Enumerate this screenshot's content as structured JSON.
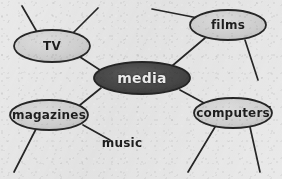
{
  "diagram": {
    "style": "hand-drawn sketch on gray paper",
    "background_color": "#e9e9e9",
    "ink_color": "#262626",
    "central_node": {
      "label": "media",
      "fill_color": "#4a4a4a",
      "text_color": "#f2f2f2",
      "cx": 142,
      "cy": 78,
      "rx": 48,
      "ry": 16,
      "font_size": 14
    },
    "nodes": [
      {
        "id": "tv",
        "label": "TV",
        "fill_color": "#d2d2d2",
        "text_color": "#1e1e1e",
        "cx": 52,
        "cy": 46,
        "rx": 38,
        "ry": 16,
        "font_size": 12
      },
      {
        "id": "films",
        "label": "films",
        "fill_color": "#d2d2d2",
        "text_color": "#1e1e1e",
        "cx": 228,
        "cy": 25,
        "rx": 38,
        "ry": 15,
        "font_size": 12
      },
      {
        "id": "magazines",
        "label": "magazines",
        "fill_color": "#d2d2d2",
        "text_color": "#1e1e1e",
        "cx": 49,
        "cy": 115,
        "rx": 39,
        "ry": 15,
        "font_size": 12
      },
      {
        "id": "computers",
        "label": "computers",
        "fill_color": "#d2d2d2",
        "text_color": "#1e1e1e",
        "cx": 233,
        "cy": 113,
        "rx": 39,
        "ry": 15,
        "font_size": 12
      }
    ],
    "text_nodes": [
      {
        "id": "music",
        "label": "music",
        "text_color": "#1e1e1e",
        "cx": 122,
        "cy": 143,
        "font_size": 12
      }
    ],
    "edges": [
      {
        "id": "media-tv",
        "from": "media",
        "to": "tv",
        "x1": 100,
        "y1": 70,
        "x2": 80,
        "y2": 57
      },
      {
        "id": "media-films",
        "from": "media",
        "to": "films",
        "x1": 172,
        "y1": 66,
        "x2": 205,
        "y2": 38
      },
      {
        "id": "media-magazines",
        "from": "media",
        "to": "magazines",
        "x1": 101,
        "y1": 88,
        "x2": 80,
        "y2": 105
      },
      {
        "id": "media-computers",
        "from": "media",
        "to": "computers",
        "x1": 180,
        "y1": 90,
        "x2": 204,
        "y2": 103
      },
      {
        "id": "magazines-music",
        "from": "magazines",
        "to": "music",
        "x1": 83,
        "y1": 125,
        "x2": 110,
        "y2": 140
      }
    ],
    "stub_branches": [
      {
        "id": "tv-stub-left",
        "from": "tv",
        "x1": 37,
        "y1": 32,
        "x2": 22,
        "y2": 6
      },
      {
        "id": "tv-stub-right",
        "from": "tv",
        "x1": 73,
        "y1": 33,
        "x2": 98,
        "y2": 8
      },
      {
        "id": "films-stub-left",
        "from": "films",
        "x1": 198,
        "y1": 18,
        "x2": 152,
        "y2": 9
      },
      {
        "id": "films-stub-right",
        "from": "films",
        "x1": 245,
        "y1": 40,
        "x2": 258,
        "y2": 80
      },
      {
        "id": "magazines-stub-down",
        "from": "magazines",
        "x1": 36,
        "y1": 129,
        "x2": 14,
        "y2": 172
      },
      {
        "id": "computers-stub-left",
        "from": "computers",
        "x1": 215,
        "y1": 127,
        "x2": 188,
        "y2": 172
      },
      {
        "id": "computers-stub-right",
        "from": "computers",
        "x1": 250,
        "y1": 127,
        "x2": 260,
        "y2": 172
      }
    ]
  }
}
